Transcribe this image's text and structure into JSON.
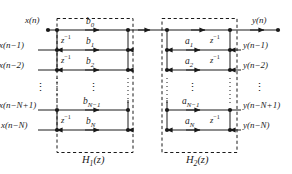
{
  "figure": {
    "type": "signal-flow-graph",
    "colors": {
      "line": "#1a1a1a",
      "dash": "#1a1a1a",
      "text": "#1a1a1a",
      "background": "#ffffff"
    }
  },
  "inputs": {
    "top_label": "x(n)",
    "taps": [
      {
        "label": "x(n−1)"
      },
      {
        "label": "x(n−2)"
      },
      {
        "label": "x(n−N+1)"
      },
      {
        "label": "x(n−N)"
      }
    ]
  },
  "outputs": {
    "top_label": "y(n)",
    "taps": [
      {
        "label": "y(n−1)"
      },
      {
        "label": "y(n−2)"
      },
      {
        "label": "y(n−N+1)"
      },
      {
        "label": "y(n−N)"
      }
    ]
  },
  "delays": {
    "symbol": "z",
    "exponent": "−1",
    "left_positions": [
      "row0-row1",
      "row1-row2",
      "row3-row4"
    ],
    "right_positions": [
      "row0-row1",
      "row1-row2",
      "row3-row4"
    ]
  },
  "coefficients": {
    "numerator": [
      {
        "name": "b",
        "index": "0",
        "label": "b0"
      },
      {
        "name": "b",
        "index": "1",
        "label": "b1"
      },
      {
        "name": "b",
        "index": "2",
        "label": "b2"
      },
      {
        "name": "b",
        "index": "N−1",
        "label": "bN−1"
      },
      {
        "name": "b",
        "index": "N",
        "label": "bN"
      }
    ],
    "denominator": [
      {
        "name": "a",
        "index": "1",
        "label": "a1"
      },
      {
        "name": "a",
        "index": "2",
        "label": "a2"
      },
      {
        "name": "a",
        "index": "N−1",
        "label": "aN−1"
      },
      {
        "name": "a",
        "index": "N",
        "label": "aN"
      }
    ]
  },
  "blocks": [
    {
      "name": "H1",
      "label_base": "H",
      "label_sub": "1",
      "label_arg": "(z)"
    },
    {
      "name": "H2",
      "label_base": "H",
      "label_sub": "2",
      "label_arg": "(z)"
    }
  ],
  "ellipsis": {
    "glyph": "⋮",
    "count": 7
  }
}
